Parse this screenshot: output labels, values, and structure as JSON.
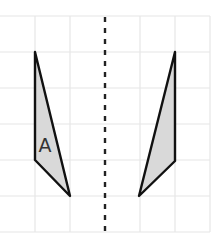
{
  "diagram": {
    "type": "reflection-grid",
    "grid": {
      "x_lines": [
        0,
        35,
        70,
        105,
        140,
        175,
        210
      ],
      "y_lines": [
        16,
        52,
        88,
        124,
        160,
        196,
        232
      ],
      "line_color": "#e4e4e4"
    },
    "mirror_line": {
      "x": 105,
      "y1": 17,
      "y2": 232,
      "style": "dashed",
      "color": "#222222"
    },
    "shapes": [
      {
        "name": "shape-a",
        "label": "A",
        "points": "35,52 35,160 70,196",
        "fill": "#d9d9d9",
        "stroke": "#111111",
        "label_x": 46,
        "label_y": 152
      },
      {
        "name": "shape-a-reflection",
        "label": "",
        "points": "175,52 175,161 139,196",
        "fill": "#d9d9d9",
        "stroke": "#111111"
      }
    ]
  }
}
